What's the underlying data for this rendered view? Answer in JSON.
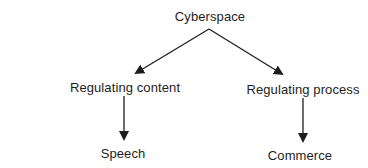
{
  "diagram": {
    "type": "tree",
    "colors": {
      "background": "#ffffff",
      "text": "#1e1e1e",
      "edge": "#1e1e1e"
    },
    "nodes": [
      {
        "id": "cyberspace",
        "label": "Cyberspace"
      },
      {
        "id": "regulating_content",
        "label": "Regulating content"
      },
      {
        "id": "regulating_process",
        "label": "Regulating process"
      },
      {
        "id": "speech",
        "label": "Speech"
      },
      {
        "id": "commerce",
        "label": "Commerce"
      }
    ],
    "edges": [
      {
        "from": "cyberspace",
        "to": "regulating_content",
        "style": "arrow"
      },
      {
        "from": "cyberspace",
        "to": "regulating_process",
        "style": "arrow"
      },
      {
        "from": "regulating_content",
        "to": "speech",
        "style": "arrow"
      },
      {
        "from": "regulating_process",
        "to": "commerce",
        "style": "arrow"
      }
    ]
  }
}
